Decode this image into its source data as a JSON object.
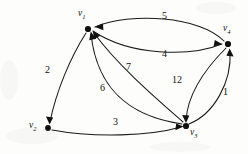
{
  "figure": {
    "type": "directed-weighted-graph",
    "background_color": "#fdfdfc",
    "ink_color": "#111111"
  },
  "nodes": [
    {
      "id": "v1",
      "label_main": "v",
      "label_sub": "1",
      "x": 88,
      "y": 29,
      "label_x": 78,
      "label_y": 9
    },
    {
      "id": "v2",
      "label_main": "v",
      "label_sub": "2",
      "x": 48,
      "y": 128,
      "label_x": 29,
      "label_y": 121
    },
    {
      "id": "v3",
      "label_main": "v",
      "label_sub": "3",
      "x": 186,
      "y": 126,
      "label_x": 190,
      "label_y": 128
    },
    {
      "id": "v4",
      "label_main": "v",
      "label_sub": "4",
      "x": 228,
      "y": 44,
      "label_x": 223,
      "label_y": 24
    }
  ],
  "edges": [
    {
      "id": "e-v4-v1",
      "from": "v4",
      "to": "v1",
      "weight": "5",
      "label_x": 162,
      "label_y": 11
    },
    {
      "id": "e-v1-v4",
      "from": "v1",
      "to": "v4",
      "weight": "4",
      "label_x": 162,
      "label_y": 49
    },
    {
      "id": "e-v1-v2",
      "from": "v1",
      "to": "v2",
      "weight": "2",
      "label_x": 45,
      "label_y": 65
    },
    {
      "id": "e-v3-v1",
      "from": "v3",
      "to": "v1",
      "weight": "6",
      "label_x": 100,
      "label_y": 83
    },
    {
      "id": "e-v3-v1b",
      "from": "v3",
      "to": "v1",
      "weight": "7",
      "label_x": 126,
      "label_y": 62
    },
    {
      "id": "e-v4-v3",
      "from": "v4",
      "to": "v3",
      "weight": "12",
      "label_x": 172,
      "label_y": 75
    },
    {
      "id": "e-v3-v4",
      "from": "v3",
      "to": "v4",
      "weight": "1",
      "label_x": 223,
      "label_y": 87
    },
    {
      "id": "e-v2-v3",
      "from": "v2",
      "to": "v3",
      "weight": "3",
      "label_x": 113,
      "label_y": 117
    }
  ]
}
